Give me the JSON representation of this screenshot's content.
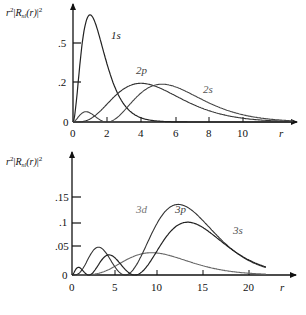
{
  "chart_data": [
    {
      "type": "line",
      "title": "",
      "ylabel": "r²|R_nl(r)|²",
      "xlabel": "r",
      "x_ticks": [
        0,
        2,
        4,
        6,
        8,
        10
      ],
      "y_ticks": [
        {
          "label": "0",
          "value": 0
        },
        {
          "label": ".2",
          "value": 0.2
        },
        {
          "label": ".5",
          "value": 0.5
        }
      ],
      "xlim": [
        0,
        13
      ],
      "ylim": [
        0,
        0.55
      ],
      "grid": false,
      "series": [
        {
          "name": "1s",
          "peak_r": 1.0,
          "peak_value": 0.54,
          "color": "#222222"
        },
        {
          "name": "2p",
          "peak_r": 4.0,
          "peak_value": 0.195,
          "color": "#333333"
        },
        {
          "name": "2s",
          "peak_r": 5.2,
          "peak_value": 0.19,
          "secondary_peak": {
            "r": 0.8,
            "value": 0.05
          },
          "color": "#444444"
        }
      ]
    },
    {
      "type": "line",
      "title": "",
      "ylabel": "r²|R_nl(r)|²",
      "xlabel": "r",
      "x_ticks": [
        0,
        5,
        10,
        15,
        20
      ],
      "y_ticks": [
        {
          "label": "0",
          "value": 0
        },
        {
          "label": ".05",
          "value": 0.05
        },
        {
          "label": ".1",
          "value": 0.1
        },
        {
          "label": ".15",
          "value": 0.15
        }
      ],
      "xlim": [
        0,
        25
      ],
      "ylim": [
        0,
        0.17
      ],
      "grid": false,
      "series": [
        {
          "name": "3d",
          "peak_r": 9.0,
          "peak_value": 0.1,
          "color": "#666666"
        },
        {
          "name": "3p",
          "peak_r": 12.0,
          "peak_value": 0.096,
          "secondary_peak": {
            "r": 2.8,
            "value": 0.035
          },
          "color": "#333333"
        },
        {
          "name": "3s",
          "peak_r": 13.1,
          "peak_value": 0.1,
          "secondary_peaks": [
            {
              "r": 0.7,
              "value": 0.015
            },
            {
              "r": 4.2,
              "value": 0.035
            }
          ],
          "color": "#222222"
        }
      ]
    }
  ],
  "top": {
    "ylabel_r": "r",
    "ylabel_sup": "2",
    "ylabel_R": "R",
    "ylabel_sub": "nl",
    "ylabel_arg": "(r)",
    "ylabel_sup2": "2",
    "x_axis_label": "r",
    "x_tick_labels": [
      "0",
      "2",
      "4",
      "6",
      "8",
      "10"
    ],
    "y_tick_labels": [
      "0",
      ".2",
      ".5"
    ],
    "curve_labels": {
      "s1": "1s",
      "p2": "2p",
      "s2": "2s"
    }
  },
  "bottom": {
    "ylabel_r": "r",
    "ylabel_sup": "2",
    "ylabel_R": "R",
    "ylabel_sub": "nl",
    "ylabel_arg": "(r)",
    "ylabel_sup2": "2",
    "x_axis_label": "r",
    "x_tick_labels": [
      "0",
      "5",
      "10",
      "15",
      "20"
    ],
    "y_tick_labels": [
      "0",
      ".05",
      ".1",
      ".15"
    ],
    "curve_labels": {
      "d3": "3d",
      "p3": "3p",
      "s3": "3s"
    }
  }
}
